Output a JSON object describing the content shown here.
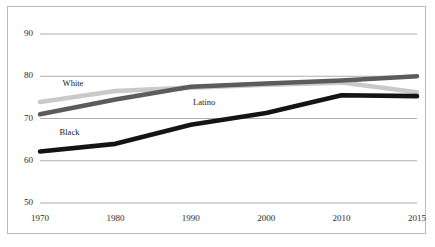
{
  "chart_data": {
    "type": "line",
    "title": "",
    "subtitle": "",
    "xlabel": "",
    "ylabel": "",
    "x": [
      1970,
      1980,
      1990,
      2000,
      2010,
      2015
    ],
    "categories": [
      "1970",
      "1980",
      "1990",
      "2000",
      "2010",
      "2015"
    ],
    "xtick_labels": [
      "1970",
      "1980",
      "1990",
      "2000",
      "2010",
      "2015"
    ],
    "ytick_labels": [
      "90",
      "80",
      "70",
      "60",
      "50"
    ],
    "yticks": [
      90,
      80,
      70,
      60,
      50
    ],
    "ylim": [
      50,
      90
    ],
    "xlim": [
      1970,
      2015
    ],
    "grid": "horizontal",
    "legend": "inline-labels",
    "series": [
      {
        "name": "White",
        "label": "White",
        "color": "#c9c9c9",
        "values": [
          73.9,
          76.5,
          77.3,
          78.0,
          78.5,
          76.2
        ]
      },
      {
        "name": "Latino",
        "label": "Latino",
        "color": "#5c5c5c",
        "values": [
          71.0,
          74.5,
          77.5,
          78.3,
          79.0,
          80.0
        ]
      },
      {
        "name": "Black",
        "label": "Black",
        "color": "#141414",
        "values": [
          62.2,
          64.0,
          68.5,
          71.3,
          75.5,
          75.3
        ]
      }
    ],
    "annotations": [
      {
        "text": "White",
        "x": 1973.0,
        "y": 77.6
      },
      {
        "text": "Latino",
        "x": 1990.3,
        "y": 73.3
      },
      {
        "text": "Black",
        "x": 1972.6,
        "y": 66.2
      }
    ],
    "colors": {
      "white_series": "#c9c9c9",
      "latino_series": "#5c5c5c",
      "black_series": "#141414",
      "gridline": "#9a9a9a",
      "border": "#b9b9b9",
      "background": "#ffffff",
      "text": "#2b2b2b"
    }
  }
}
